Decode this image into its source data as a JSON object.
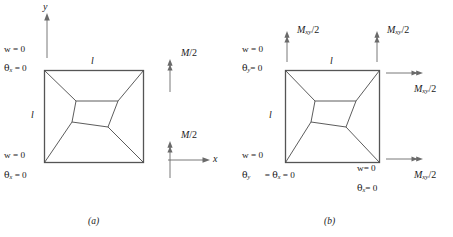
{
  "figure": {
    "type": "two-panel engineering diagram",
    "panels": [
      {
        "id": "a",
        "caption": "(a)",
        "axes": {
          "x_label": "x",
          "y_label": "y"
        },
        "dimensions": {
          "top": "l",
          "left": "l"
        },
        "boundary_conditions": [
          {
            "position": "top-left",
            "lines": [
              "w = 0",
              "θx = 0"
            ]
          },
          {
            "position": "bottom-left",
            "lines": [
              "w = 0",
              "θx = 0"
            ]
          }
        ],
        "loads": [
          {
            "position": "top-right",
            "label": "M/2",
            "arrow": "up"
          },
          {
            "position": "bottom-right",
            "label": "M/2",
            "arrow": "up"
          }
        ]
      },
      {
        "id": "b",
        "caption": "(b)",
        "dimensions": {
          "top": "l",
          "left": "l"
        },
        "boundary_conditions": [
          {
            "position": "top-left",
            "lines": [
              "w = 0",
              "θy = 0"
            ]
          },
          {
            "position": "bottom-left",
            "lines": [
              "w = 0",
              "θy = θx = 0"
            ]
          },
          {
            "position": "bottom-right",
            "lines": [
              "w= 0",
              "θx= 0"
            ]
          }
        ],
        "loads": [
          {
            "position": "top-left-edge",
            "label": "Mxy/2",
            "arrow": "up"
          },
          {
            "position": "top-right-edge",
            "label": "Mxy/2",
            "arrow": "up"
          },
          {
            "position": "right-top",
            "label": "Mxy/2",
            "arrow": "right"
          },
          {
            "position": "right-bottom",
            "label": "Mxy/2",
            "arrow": "right"
          }
        ]
      }
    ],
    "labels": {
      "w_zero": "w = 0",
      "w_zero_tight": "w= 0",
      "theta_sym": "θ",
      "sub_x": "x",
      "sub_y": "y",
      "sub_xy": "xy",
      "eq_zero": " = 0",
      "eq_zero_tight": "= 0",
      "dim_l": "l",
      "axis_x": "x",
      "axis_y": "y",
      "moment_M": "M",
      "moment_Mxy": "M",
      "over_two": "/2",
      "caption_a": "(a)",
      "caption_b": "(b)"
    },
    "colors": {
      "stroke": "#3a3a3a",
      "plate_edge": "#555555",
      "background": "#ffffff",
      "text": "#1a1a1a"
    }
  }
}
